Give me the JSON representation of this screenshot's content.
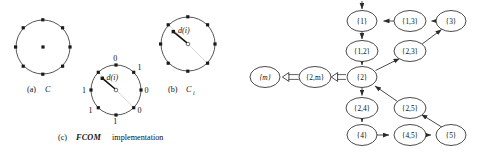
{
  "figure": {
    "background_color": "#ffffff",
    "ink_color": "#1a1a1a"
  },
  "panel_a": {
    "caption_prefix": "(a)",
    "caption_symbol": "C",
    "center_x": 43,
    "center_y": 47,
    "radius": 27,
    "num_points": 8,
    "has_center_point": true
  },
  "panel_b": {
    "caption_prefix": "(b)",
    "caption_symbol": "C",
    "caption_subscript": "i",
    "center_x": 188,
    "center_y": 44,
    "radius": 27,
    "num_points": 8,
    "vector_label": "d(i)",
    "has_center_point": true
  },
  "panel_c": {
    "caption_prefix": "(c)",
    "caption_symbol": "FCOM",
    "caption_suffix": "implementation",
    "center_x": 116,
    "center_y": 90,
    "radius": 25,
    "num_points": 8,
    "vector_label": "d(i)",
    "bit_labels": [
      {
        "index": 0,
        "angle_deg": -90,
        "value": "0"
      },
      {
        "index": 1,
        "angle_deg": -45,
        "value": "1"
      },
      {
        "index": 2,
        "angle_deg": 0,
        "value": "0"
      },
      {
        "index": 3,
        "angle_deg": 45,
        "value": "0"
      },
      {
        "index": 4,
        "angle_deg": 90,
        "value": "1"
      },
      {
        "index": 5,
        "angle_deg": 135,
        "value": "1"
      },
      {
        "index": 6,
        "angle_deg": 180,
        "value": "1"
      },
      {
        "index": 7,
        "angle_deg": -135,
        "value": ""
      }
    ]
  },
  "graph": {
    "nodes": [
      {
        "id": "n1",
        "label": "{1}",
        "x": 362,
        "y": 21,
        "rx": 15,
        "ry": 10.5
      },
      {
        "id": "n13",
        "label": "{1,3}",
        "x": 410,
        "y": 21,
        "rx": 16,
        "ry": 10.5
      },
      {
        "id": "n3",
        "label": "{3}",
        "x": 451,
        "y": 21,
        "rx": 15,
        "ry": 10.5
      },
      {
        "id": "n12",
        "label": "{1,2}",
        "x": 362,
        "y": 51,
        "rx": 16,
        "ry": 10.5
      },
      {
        "id": "n23",
        "label": "{2,3}",
        "x": 410,
        "y": 51,
        "rx": 16,
        "ry": 10.5
      },
      {
        "id": "nm",
        "label": "{m}",
        "x": 265,
        "y": 77,
        "rx": 15,
        "ry": 10.5
      },
      {
        "id": "n2m",
        "label": "{2,m}",
        "x": 315,
        "y": 77,
        "rx": 16,
        "ry": 10.5
      },
      {
        "id": "n2",
        "label": "{2}",
        "x": 362,
        "y": 77,
        "rx": 15,
        "ry": 10.5
      },
      {
        "id": "n24",
        "label": "{2,4}",
        "x": 362,
        "y": 108,
        "rx": 16,
        "ry": 10.5
      },
      {
        "id": "n25",
        "label": "{2,5}",
        "x": 410,
        "y": 108,
        "rx": 16,
        "ry": 10.5
      },
      {
        "id": "n4",
        "label": "{4}",
        "x": 362,
        "y": 135,
        "rx": 15,
        "ry": 10.5
      },
      {
        "id": "n45",
        "label": "{4,5}",
        "x": 410,
        "y": 135,
        "rx": 16,
        "ry": 10.5
      },
      {
        "id": "n5",
        "label": "{5}",
        "x": 451,
        "y": 135,
        "rx": 15,
        "ry": 10.5
      }
    ],
    "edges": [
      {
        "from": "entry",
        "to": "n1",
        "style": "single"
      },
      {
        "from": "n1",
        "to": "n12",
        "style": "single"
      },
      {
        "from": "n12",
        "to": "n2",
        "style": "single"
      },
      {
        "from": "n13",
        "to": "n1",
        "style": "single"
      },
      {
        "from": "n3",
        "to": "n13",
        "style": "single"
      },
      {
        "from": "n2",
        "to": "n23",
        "style": "single"
      },
      {
        "from": "n23",
        "to": "n3",
        "style": "single"
      },
      {
        "from": "n2",
        "to": "n2m",
        "style": "double"
      },
      {
        "from": "n2m",
        "to": "nm",
        "style": "double"
      },
      {
        "from": "n2",
        "to": "n24",
        "style": "single"
      },
      {
        "from": "n24",
        "to": "n4",
        "style": "single"
      },
      {
        "from": "n4",
        "to": "n45",
        "style": "single"
      },
      {
        "from": "n45",
        "to": "n5",
        "style": "single"
      },
      {
        "from": "n5",
        "to": "n25",
        "style": "single"
      },
      {
        "from": "n25",
        "to": "n2",
        "style": "single"
      }
    ]
  }
}
